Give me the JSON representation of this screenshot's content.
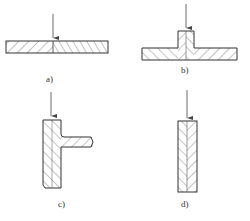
{
  "diagram": {
    "colors": {
      "line": "#333333",
      "hatch": "#555555",
      "background": "#ffffff"
    },
    "panels": [
      {
        "id": "a",
        "label": "a)",
        "description": "butt joint of two flat plates, load arrow at seam"
      },
      {
        "id": "b",
        "label": "b)",
        "description": "T-joint: vertical stem on horizontal plate, load arrow from top"
      },
      {
        "id": "c",
        "label": "c)",
        "description": "corner joint: vertical bar with horizontal arm, load arrow from top"
      },
      {
        "id": "d",
        "label": "d)",
        "description": "lap/edge joint of two vertical plates, load arrow from top"
      }
    ]
  }
}
